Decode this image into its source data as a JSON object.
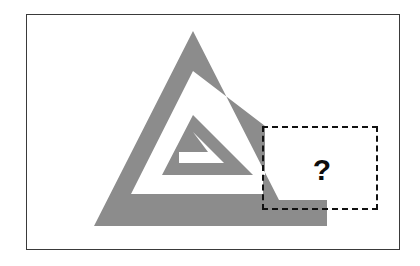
{
  "canvas": {
    "width": 420,
    "height": 266,
    "background_color": "#ffffff"
  },
  "frame": {
    "name": "puzzle-frame",
    "x": 26,
    "y": 14,
    "width": 374,
    "height": 236,
    "border_color": "#3a3a3a",
    "border_width": 1.6,
    "fill_color": "#ffffff"
  },
  "figure": {
    "name": "gray-spiral-triangle",
    "fill_color": "#8c8c8c",
    "stroke_width": 16,
    "apex": {
      "x": 193,
      "y": 31
    },
    "bottom_left": {
      "x": 94,
      "y": 226
    },
    "bottom_right_end": {
      "x": 327,
      "y": 226
    },
    "turns": 3
  },
  "answer_box": {
    "name": "answer-box",
    "x": 262,
    "y": 126,
    "width": 116,
    "height": 84,
    "border_style": "dashed",
    "border_color": "#111111",
    "border_width": 2,
    "label": "?",
    "label_color": "#0d0d0d"
  },
  "colors": {
    "gray": "#8c8c8c",
    "black": "#0d0d0d",
    "frame": "#3a3a3a",
    "white": "#ffffff"
  }
}
